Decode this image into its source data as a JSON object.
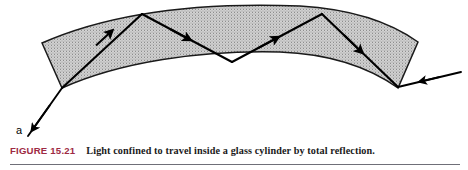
{
  "figure": {
    "label": "FIGURE 15.21",
    "label_color": "#9e2a43",
    "caption": "Light confined to travel inside a glass cylinder by total reflection.",
    "rule_color": "#6f6f78"
  },
  "diagram": {
    "title": "Light confined to travel inside a glass cylinder by total reflection",
    "entry_label": "a",
    "band_fill": "#c9c9c9",
    "band_stroke": "#1a1a1a",
    "ray_stroke": "#000000",
    "band": {
      "top_edge": "M42,43 C110,13 200,2 300,6 C350,9 390,22 418,42",
      "bottom_edge": "M62,88 C120,62 200,50 280,52 C330,54 370,68 398,88",
      "left_cap": "M42,43 L62,88",
      "right_cap": "M418,42 L398,88"
    },
    "ray_path": {
      "incoming": {
        "x1": 28,
        "y1": 136,
        "x2": 62,
        "y2": 88
      },
      "segments": [
        {
          "x1": 62,
          "y1": 88,
          "x2": 142,
          "y2": 14,
          "name": "segment-1-up"
        },
        {
          "x1": 142,
          "y1": 14,
          "x2": 232,
          "y2": 62,
          "name": "segment-2-down"
        },
        {
          "x1": 232,
          "y1": 62,
          "x2": 322,
          "y2": 14,
          "name": "segment-3-up"
        },
        {
          "x1": 322,
          "y1": 14,
          "x2": 398,
          "y2": 87,
          "name": "segment-4-down"
        }
      ],
      "outgoing": {
        "x1": 398,
        "y1": 87,
        "x2": 461,
        "y2": 72
      },
      "arrow_count": 6
    }
  }
}
